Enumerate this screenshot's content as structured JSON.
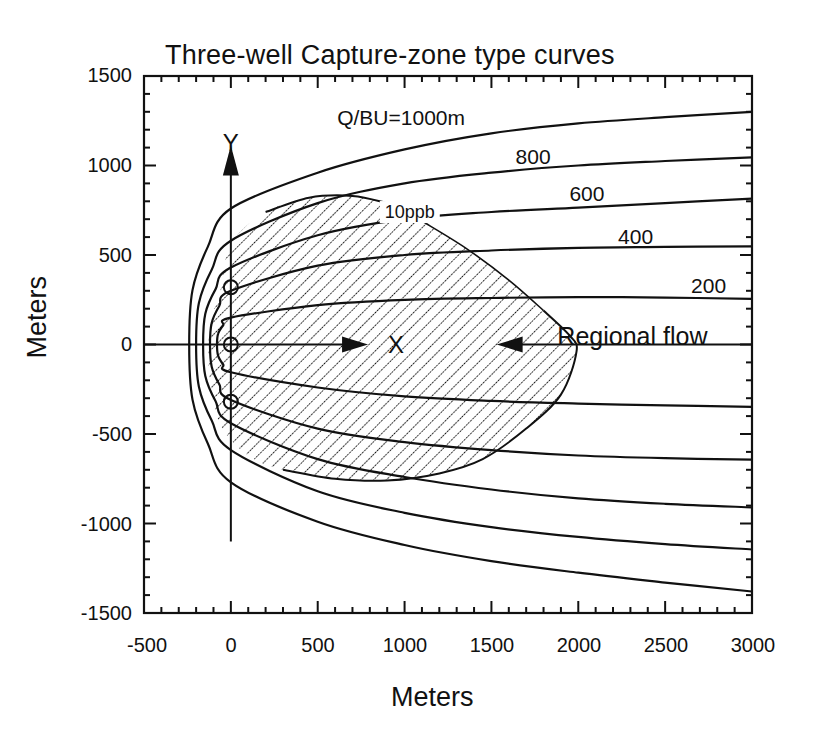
{
  "chart_data": {
    "type": "line",
    "title": "Three-well Capture-zone type curves",
    "xlabel": "Meters",
    "ylabel": "Meters",
    "xlim": [
      -500,
      3000
    ],
    "ylim": [
      -1500,
      1500
    ],
    "xticks": [
      -500,
      0,
      500,
      1000,
      1500,
      2000,
      2500,
      3000
    ],
    "yticks": [
      1500,
      1000,
      500,
      0,
      -500,
      -1000,
      -1500
    ],
    "minor_tick_step": 100,
    "grid": false,
    "legend": null,
    "wells": [
      {
        "x": 0,
        "y": 320
      },
      {
        "x": 0,
        "y": 0
      },
      {
        "x": 0,
        "y": -320
      }
    ],
    "series": [
      {
        "name": "Q/BU=1000m",
        "label": "Q/BU=1000m",
        "stagnation_x": -240,
        "x": [
          0,
          500,
          1000,
          1500,
          2000,
          2500,
          3000
        ],
        "upper": [
          760,
          960,
          1090,
          1180,
          1235,
          1270,
          1300
        ],
        "lower": [
          -770,
          -990,
          -1120,
          -1210,
          -1275,
          -1330,
          -1380
        ]
      },
      {
        "name": "800",
        "label": "800",
        "stagnation_x": -200,
        "x": [
          0,
          500,
          1000,
          1500,
          2000,
          2500,
          3000
        ],
        "upper": [
          580,
          790,
          900,
          960,
          1000,
          1025,
          1045
        ],
        "lower": [
          -590,
          -820,
          -940,
          -1020,
          -1075,
          -1115,
          -1145
        ]
      },
      {
        "name": "600",
        "label": "600",
        "stagnation_x": -160,
        "x": [
          0,
          500,
          1000,
          1500,
          2000,
          2500,
          3000
        ],
        "upper": [
          430,
          610,
          700,
          740,
          765,
          790,
          815
        ],
        "lower": [
          -440,
          -640,
          -740,
          -810,
          -860,
          -890,
          -910
        ]
      },
      {
        "name": "400",
        "label": "400",
        "stagnation_x": -120,
        "x": [
          0,
          500,
          1000,
          1500,
          2000,
          2500,
          3000
        ],
        "upper": [
          300,
          440,
          500,
          525,
          540,
          545,
          548
        ],
        "lower": [
          -310,
          -470,
          -545,
          -590,
          -620,
          -635,
          -643
        ]
      },
      {
        "name": "200",
        "label": "200",
        "stagnation_x": -80,
        "x": [
          0,
          500,
          1000,
          1500,
          2000,
          2500,
          3000
        ],
        "upper": [
          150,
          220,
          250,
          260,
          265,
          262,
          255
        ],
        "lower": [
          -155,
          -240,
          -290,
          -315,
          -330,
          -340,
          -348
        ]
      }
    ],
    "plume_10ppb": {
      "label": "10ppb",
      "boundary": [
        [
          -60,
          300
        ],
        [
          0,
          560
        ],
        [
          200,
          740
        ],
        [
          450,
          820
        ],
        [
          700,
          830
        ],
        [
          900,
          790
        ],
        [
          1100,
          690
        ],
        [
          1350,
          540
        ],
        [
          1600,
          360
        ],
        [
          1800,
          190
        ],
        [
          1950,
          50
        ],
        [
          1990,
          -40
        ],
        [
          1900,
          -280
        ],
        [
          1700,
          -470
        ],
        [
          1450,
          -640
        ],
        [
          1200,
          -720
        ],
        [
          900,
          -760
        ],
        [
          600,
          -750
        ],
        [
          300,
          -700
        ],
        [
          100,
          -620
        ],
        [
          -60,
          -450
        ],
        [
          -120,
          -200
        ],
        [
          -130,
          0
        ],
        [
          -110,
          150
        ]
      ]
    },
    "annotations": [
      {
        "text": "Q/BU=1000m",
        "x": 980,
        "y": 1270
      },
      {
        "text": "800",
        "x": 1740,
        "y": 1050
      },
      {
        "text": "600",
        "x": 2050,
        "y": 840
      },
      {
        "text": "400",
        "x": 2330,
        "y": 600
      },
      {
        "text": "200",
        "x": 2750,
        "y": 330
      },
      {
        "text": "10ppb",
        "x": 1030,
        "y": 740
      },
      {
        "text": "X",
        "x": 950,
        "y": 0
      },
      {
        "text": "Y",
        "x": 0,
        "y": 1130
      },
      {
        "text": "Regional flow",
        "x": 2340,
        "y": 45
      }
    ],
    "arrows": {
      "x_axis_arrow_tip": [
        790,
        0
      ],
      "y_axis_arrow_tip": [
        0,
        1090
      ],
      "y_axis_line_bottom": -1100,
      "regional_flow_arrow_tip": [
        1530,
        0
      ]
    }
  },
  "text": {
    "title": "Three-well Capture-zone type curves",
    "xlabel": "Meters",
    "ylabel": "Meters",
    "x_axis_name": "X",
    "y_axis_name": "Y",
    "regional_flow": "Regional flow",
    "plume_label": "10ppb",
    "curve_labels": [
      "Q/BU=1000m",
      "800",
      "600",
      "400",
      "200"
    ],
    "xticks": [
      "-500",
      "0",
      "500",
      "1000",
      "1500",
      "2000",
      "2500",
      "3000"
    ],
    "yticks": [
      "1500",
      "1000",
      "500",
      "0",
      "-500",
      "-1000",
      "-1500"
    ]
  }
}
